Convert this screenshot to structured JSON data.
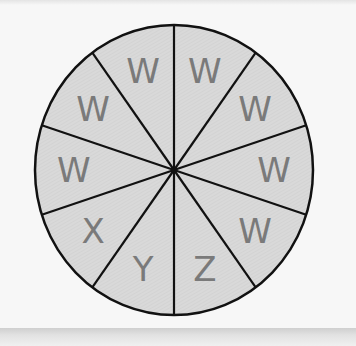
{
  "spinner": {
    "sector_count": 10,
    "fill_color": "#d8d8d8",
    "line_color": "#111111",
    "label_color": "#7a7a7a",
    "labels_clockwise_from_top": [
      "W",
      "W",
      "W",
      "W",
      "Z",
      "Y",
      "X",
      "W",
      "W",
      "W"
    ]
  }
}
